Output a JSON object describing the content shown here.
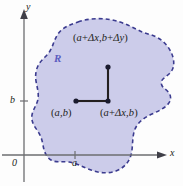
{
  "figure": {
    "caption_visible": false,
    "background_color": "#fdfdfd",
    "region": {
      "label": "R",
      "label_color": "#5b5bbf",
      "fill_color": "#ccccea",
      "border_color": "#3b3b8f",
      "border_style": "dashed"
    },
    "axes": {
      "x_label": "x",
      "y_label": "y",
      "origin_label": "0",
      "axis_color": "#58595b",
      "x_tick_label": "a",
      "y_tick_label": "b"
    },
    "points": [
      {
        "name": "lower-left-corner",
        "label": "(a,b)",
        "label_parts": {
          "open": "(",
          "x": "a",
          "comma": ",",
          "y": "b",
          "close": ")"
        }
      },
      {
        "name": "lower-right-corner",
        "label": "(a + Δx, b)",
        "label_parts": {
          "open": "(",
          "x1": "a",
          "plus": "+",
          "dx": "Δx",
          "comma": ",",
          "y": "b",
          "close": ")"
        }
      },
      {
        "name": "upper-right-corner",
        "label": "(a + Δx, b + Δy)",
        "label_parts": {
          "open": "(",
          "x1": "a",
          "plus1": "+",
          "dx": "Δx",
          "comma": ",",
          "y1": "b",
          "plus2": "+",
          "dy": "Δy",
          "close": ")"
        }
      }
    ],
    "segment_color": "#231f20",
    "dot_color": "#1a1a2e"
  }
}
